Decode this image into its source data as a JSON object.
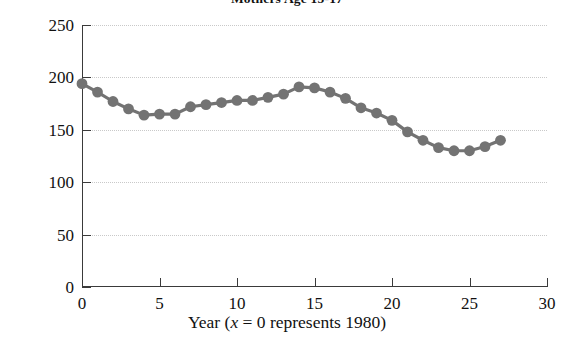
{
  "chart_data": {
    "type": "line",
    "title": "Mothers Age 15-17",
    "xlabel": "Year (x = 0 represents 1980)",
    "xlabel_parts": {
      "before": "Year (",
      "italic": "x",
      "after": " = 0 represents 1980)"
    },
    "ylabel": "Births (1000s)",
    "xlim": [
      0,
      30
    ],
    "ylim": [
      0,
      250
    ],
    "xticks": [
      0,
      5,
      10,
      15,
      20,
      25,
      30
    ],
    "yticks": [
      0,
      50,
      100,
      150,
      200,
      250
    ],
    "grid": "horizontal dotted gridlines at each y tick",
    "legend": "none",
    "marker": "filled circle",
    "marker_color": "#737373",
    "line_color": "#737373",
    "x": [
      0,
      1,
      2,
      3,
      4,
      5,
      6,
      7,
      8,
      9,
      10,
      11,
      12,
      13,
      14,
      15,
      16,
      17,
      18,
      19,
      20,
      21,
      22,
      23,
      24,
      25,
      26,
      27
    ],
    "values": [
      194,
      186,
      177,
      170,
      164,
      165,
      165,
      172,
      174,
      176,
      178,
      178,
      181,
      184,
      191,
      190,
      186,
      180,
      171,
      166,
      159,
      148,
      140,
      133,
      130,
      130,
      134,
      140
    ],
    "series": [
      {
        "name": "Births to mothers age 15-17 (1000s)",
        "values": [
          194,
          186,
          177,
          170,
          164,
          165,
          165,
          172,
          174,
          176,
          178,
          178,
          181,
          184,
          191,
          190,
          186,
          180,
          171,
          166,
          159,
          148,
          140,
          133,
          130,
          130,
          134,
          140
        ]
      }
    ]
  }
}
